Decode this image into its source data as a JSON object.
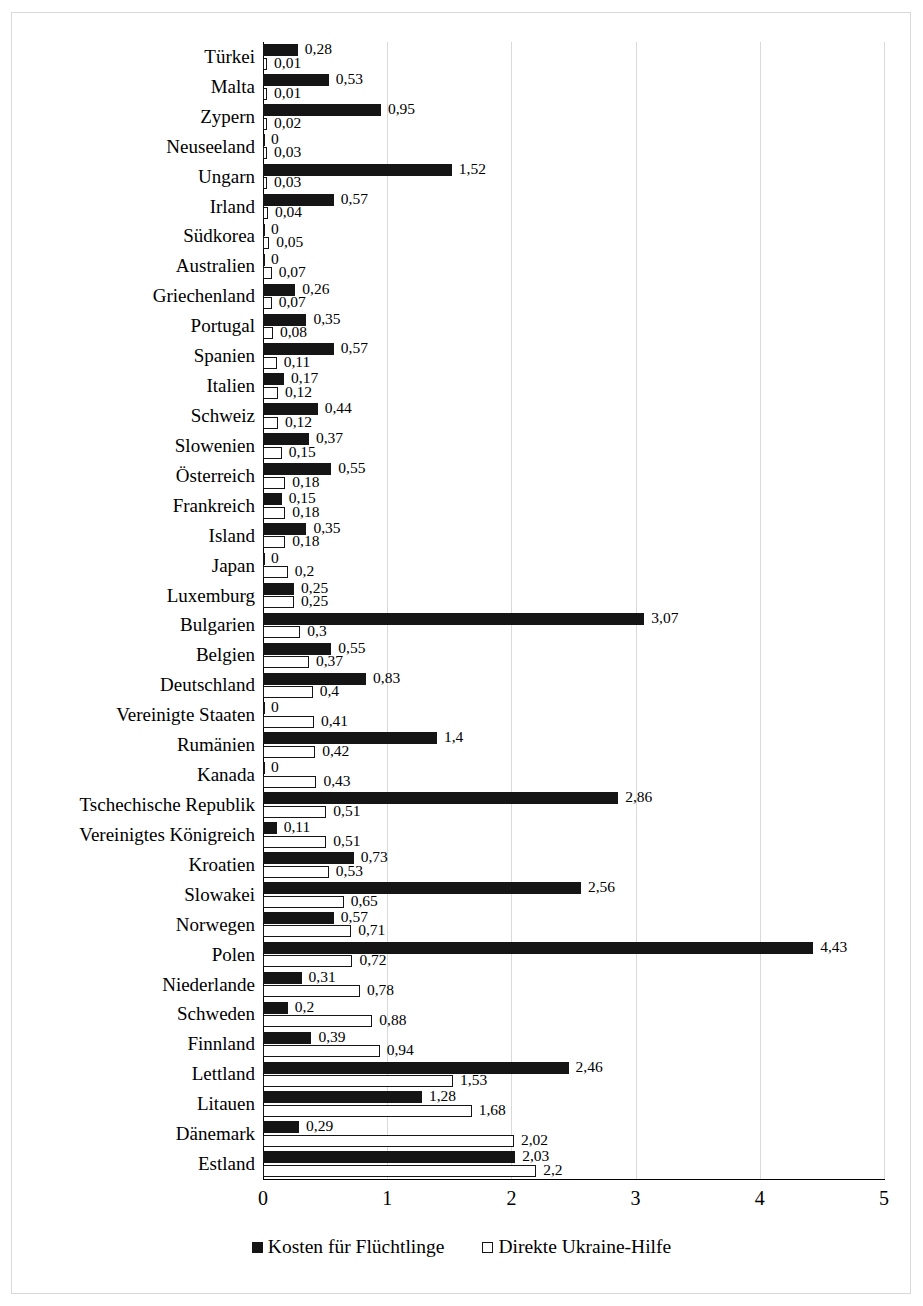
{
  "chart_data": {
    "type": "bar",
    "orientation": "horizontal",
    "title": "",
    "subtitle": "",
    "xlabel": "",
    "ylabel": "",
    "xlim": [
      0,
      5
    ],
    "xticks": [
      "0",
      "1",
      "2",
      "3",
      "4",
      "5"
    ],
    "grid": true,
    "legend_position": "bottom",
    "value_label_decimal_separator": ",",
    "colors": {
      "refugee_costs": "#151515",
      "direct_aid": "#ffffff",
      "bar_outline": "#151515",
      "gridline": "#d9d9d9",
      "axis": "#000000",
      "frame": "#d9d9d9",
      "text": "#000000"
    },
    "series": [
      {
        "name": "Kosten für Flüchtlinge",
        "key": "refugee_costs",
        "values": [
          0.28,
          0.53,
          0.95,
          0,
          1.52,
          0.57,
          0,
          0,
          0.26,
          0.35,
          0.57,
          0.17,
          0.44,
          0.37,
          0.55,
          0.15,
          0.35,
          0,
          0.25,
          3.07,
          0.55,
          0.83,
          0,
          1.4,
          0,
          2.86,
          0.11,
          0.73,
          2.56,
          0.57,
          4.43,
          0.31,
          0.2,
          0.39,
          2.46,
          1.28,
          0.29,
          2.03
        ],
        "labels": [
          "0,28",
          "0,53",
          "0,95",
          "0",
          "1,52",
          "0,57",
          "0",
          "0",
          "0,26",
          "0,35",
          "0,57",
          "0,17",
          "0,44",
          "0,37",
          "0,55",
          "0,15",
          "0,35",
          "0",
          "0,25",
          "3,07",
          "0,55",
          "0,83",
          "0",
          "1,4",
          "0",
          "2,86",
          "0,11",
          "0,73",
          "2,56",
          "0,57",
          "4,43",
          "0,31",
          "0,2",
          "0,39",
          "2,46",
          "1,28",
          "0,29",
          "2,03"
        ]
      },
      {
        "name": "Direkte Ukraine-Hilfe",
        "key": "direct_aid",
        "values": [
          0.01,
          0.01,
          0.02,
          0.03,
          0.03,
          0.04,
          0.05,
          0.07,
          0.07,
          0.08,
          0.11,
          0.12,
          0.12,
          0.15,
          0.18,
          0.18,
          0.18,
          0.2,
          0.25,
          0.3,
          0.37,
          0.4,
          0.41,
          0.42,
          0.43,
          0.51,
          0.51,
          0.53,
          0.65,
          0.71,
          0.72,
          0.78,
          0.88,
          0.94,
          1.53,
          1.68,
          2.02,
          2.2
        ],
        "labels": [
          "0,01",
          "0,01",
          "0,02",
          "0,03",
          "0,03",
          "0,04",
          "0,05",
          "0,07",
          "0,07",
          "0,08",
          "0,11",
          "0,12",
          "0,12",
          "0,15",
          "0,18",
          "0,18",
          "0,18",
          "0,2",
          "0,25",
          "0,3",
          "0,37",
          "0,4",
          "0,41",
          "0,42",
          "0,43",
          "0,51",
          "0,51",
          "0,53",
          "0,65",
          "0,71",
          "0,72",
          "0,78",
          "0,88",
          "0,94",
          "1,53",
          "1,68",
          "2,02",
          "2,2"
        ]
      }
    ],
    "categories": [
      "Türkei",
      "Malta",
      "Zypern",
      "Neuseeland",
      "Ungarn",
      "Irland",
      "Südkorea",
      "Australien",
      "Griechenland",
      "Portugal",
      "Spanien",
      "Italien",
      "Schweiz",
      "Slowenien",
      "Österreich",
      "Frankreich",
      "Island",
      "Japan",
      "Luxemburg",
      "Bulgarien",
      "Belgien",
      "Deutschland",
      "Vereinigte Staaten",
      "Rumänien",
      "Kanada",
      "Tschechische Republik",
      "Vereinigtes Königreich",
      "Kroatien",
      "Slowakei",
      "Norwegen",
      "Polen",
      "Niederlande",
      "Schweden",
      "Finnland",
      "Lettland",
      "Litauen",
      "Dänemark",
      "Estland"
    ]
  },
  "legend": {
    "items": [
      {
        "label": "Kosten für Flüchtlinge",
        "swatch": "filled-square-icon"
      },
      {
        "label": "Direkte Ukraine-Hilfe",
        "swatch": "hollow-square-icon"
      }
    ]
  }
}
